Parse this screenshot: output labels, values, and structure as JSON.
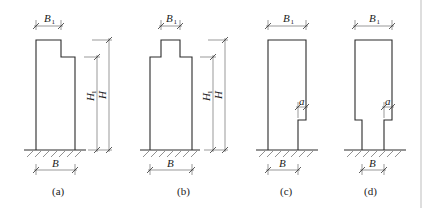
{
  "figure": {
    "panels": [
      {
        "id": "a",
        "caption": "(a)",
        "labels": {
          "top_width": "B",
          "top_width_sub": "1",
          "base_width": "B",
          "height": "H",
          "height1": "H",
          "height1_sub": "1"
        }
      },
      {
        "id": "b",
        "caption": "(b)",
        "labels": {
          "top_width": "B",
          "top_width_sub": "1",
          "base_width": "B",
          "height": "H",
          "height1": "H",
          "height1_sub": "1"
        }
      },
      {
        "id": "c",
        "caption": "(c)",
        "labels": {
          "top_width": "B",
          "top_width_sub": "1",
          "base_width": "B",
          "offset": "a"
        }
      },
      {
        "id": "d",
        "caption": "(d)",
        "labels": {
          "top_width": "B",
          "top_width_sub": "1",
          "base_width": "B",
          "offset": "a"
        }
      }
    ],
    "colors": {
      "line": "#2a2a2a",
      "dimension": "#555555",
      "background": "#ffffff",
      "rule": "#bdbdbd"
    }
  }
}
